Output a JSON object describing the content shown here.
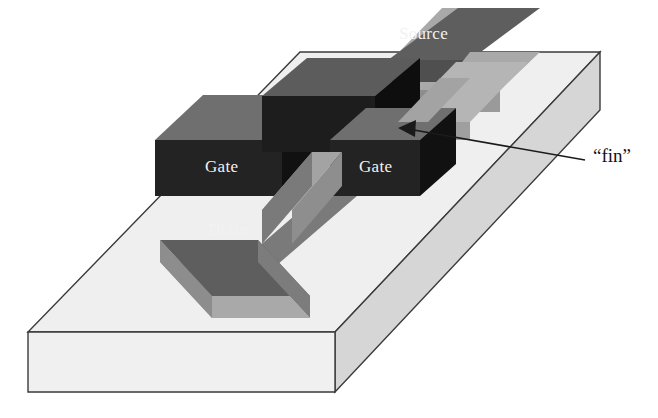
{
  "figure": {
    "kind": "finfet-3d-schematic",
    "device": "FinFET transistor",
    "background_color": "#ffffff",
    "outline_color": "#3a3a3a"
  },
  "labels": {
    "source": "Source",
    "gate_left": "Gate",
    "gate_right": "Gate",
    "drain": "Drain",
    "fin": "“fin”"
  },
  "colors": {
    "substrate_top": "#efefef",
    "substrate_front": "#f0f0f0",
    "substrate_side": "#d6d6d6",
    "gate_front": "#232323",
    "gate_top": "#6f6f6f",
    "gate_side": "#111111",
    "contact_top": "#5e5e5e",
    "contact_side": "#a9a9a9",
    "contact_front": "#8d8d8d",
    "fin_top": "#a3a3a3",
    "fin_side": "#7a7a7a",
    "label_on_block": "#f2f2f2",
    "label_callout": "#111111"
  },
  "callout": {
    "target_label": "fin",
    "arrow_tip": {
      "x": 400,
      "y": 128
    },
    "arrow_tail": {
      "x": 585,
      "y": 160
    },
    "arrow_head": "left-pointing-triangle"
  },
  "parts": [
    {
      "name": "substrate",
      "role": "silicon wafer base slab"
    },
    {
      "name": "fin",
      "role": "narrow vertical silicon channel ribbon"
    },
    {
      "name": "gate-left",
      "role": "gate electrode wrapping fin, left arm"
    },
    {
      "name": "gate-right",
      "role": "gate electrode wrapping fin, right arm"
    },
    {
      "name": "source-contact",
      "role": "source terminal pad"
    },
    {
      "name": "drain-contact",
      "role": "drain terminal pad"
    }
  ]
}
